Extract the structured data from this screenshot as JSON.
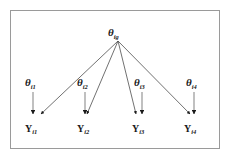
{
  "figure": {
    "name": "hierarchical-path-diagram",
    "border_color": "#9a9a9a",
    "background_color": "#ffffff",
    "line_color": "#4d4d4d",
    "arrow_color": "#1a1a1a",
    "stem_color": "#8c8c8c"
  },
  "general_factor": {
    "symbol": "θ",
    "subscript": "ig",
    "x": 118,
    "y": 33
  },
  "specific_factors": [
    {
      "symbol": "θ",
      "subscript": "i1",
      "x": 32,
      "y": 83
    },
    {
      "symbol": "θ",
      "subscript": "i2",
      "x": 84,
      "y": 83
    },
    {
      "symbol": "θ",
      "subscript": "i3",
      "x": 139,
      "y": 83
    },
    {
      "symbol": "θ",
      "subscript": "i4",
      "x": 191,
      "y": 83
    }
  ],
  "indicators": [
    {
      "symbol": "Y",
      "subscript": "i1",
      "x": 29,
      "y": 129
    },
    {
      "symbol": "Y",
      "subscript": "i2",
      "x": 81,
      "y": 129
    },
    {
      "symbol": "Y",
      "subscript": "i3",
      "x": 136,
      "y": 129
    },
    {
      "symbol": "Y",
      "subscript": "i4",
      "x": 188,
      "y": 129
    }
  ],
  "paths": {
    "general_to_indicator": [
      {
        "from": "theta-ig",
        "to": "Y-i1"
      },
      {
        "from": "theta-ig",
        "to": "Y-i2"
      },
      {
        "from": "theta-ig",
        "to": "Y-i3"
      },
      {
        "from": "theta-ig",
        "to": "Y-i4"
      }
    ],
    "specific_to_indicator": [
      {
        "from": "theta-i1",
        "to": "Y-i1"
      },
      {
        "from": "theta-i2",
        "to": "Y-i2"
      },
      {
        "from": "theta-i3",
        "to": "Y-i3"
      },
      {
        "from": "theta-i4",
        "to": "Y-i4"
      }
    ]
  }
}
